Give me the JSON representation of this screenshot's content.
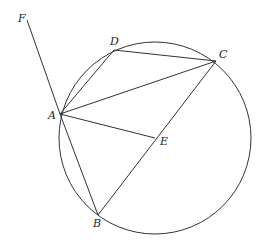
{
  "diagram": {
    "type": "geometry",
    "colors": {
      "stroke": "#333333",
      "label": "#222222",
      "background": "#ffffff"
    },
    "circle": {
      "cx": 155,
      "cy": 138,
      "r": 96
    },
    "points": {
      "A": {
        "label": "A",
        "x": 60,
        "y": 114
      },
      "B": {
        "label": "B",
        "x": 98,
        "y": 215
      },
      "C": {
        "label": "C",
        "x": 216,
        "y": 61
      },
      "D": {
        "label": "D",
        "x": 114,
        "y": 50
      },
      "E": {
        "label": "E",
        "x": 155,
        "y": 138
      },
      "F": {
        "label": "F",
        "x": 27,
        "y": 20
      }
    },
    "segments": [
      [
        "F",
        "A"
      ],
      [
        "A",
        "D"
      ],
      [
        "D",
        "C"
      ],
      [
        "A",
        "C"
      ],
      [
        "A",
        "E"
      ],
      [
        "A",
        "B"
      ],
      [
        "B",
        "C"
      ]
    ]
  }
}
